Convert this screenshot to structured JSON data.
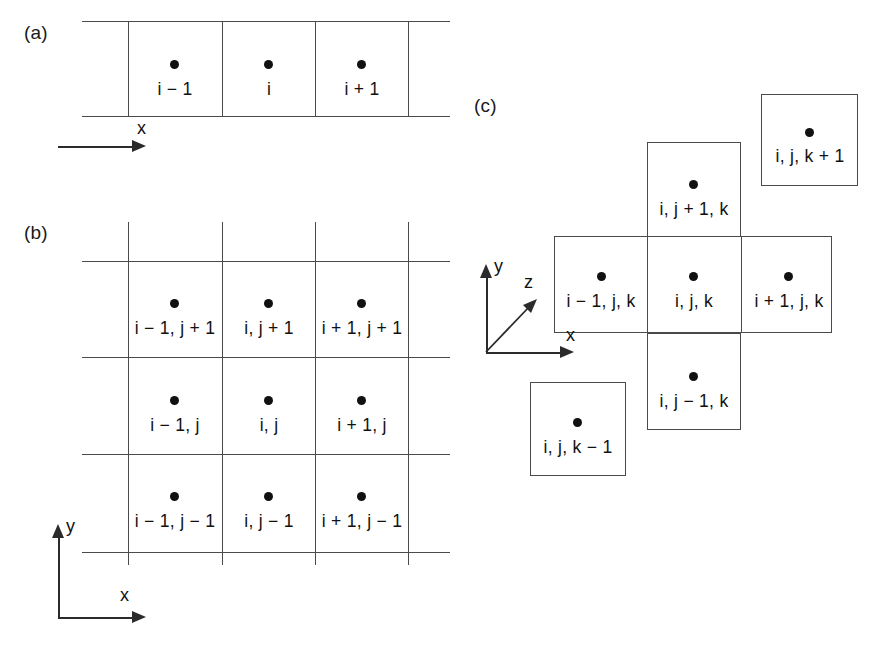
{
  "figure": {
    "type": "diagram",
    "panels": [
      {
        "id": "a",
        "label": "(a)",
        "dimension": "1D",
        "cells": [
          {
            "label": "i − 1"
          },
          {
            "label": "i"
          },
          {
            "label": "i + 1"
          }
        ],
        "axes": [
          {
            "name": "x",
            "direction": "right"
          }
        ]
      },
      {
        "id": "b",
        "label": "(b)",
        "dimension": "2D",
        "rows": [
          {
            "cells": [
              {
                "label": "i − 1, j + 1"
              },
              {
                "label": "i, j + 1"
              },
              {
                "label": "i + 1, j + 1"
              }
            ]
          },
          {
            "cells": [
              {
                "label": "i − 1, j"
              },
              {
                "label": "i, j"
              },
              {
                "label": "i + 1, j"
              }
            ]
          },
          {
            "cells": [
              {
                "label": "i − 1, j − 1"
              },
              {
                "label": "i, j − 1"
              },
              {
                "label": "i + 1, j − 1"
              }
            ]
          }
        ],
        "axes": [
          {
            "name": "y",
            "direction": "up"
          },
          {
            "name": "x",
            "direction": "right"
          }
        ]
      },
      {
        "id": "c",
        "label": "(c)",
        "dimension": "3D",
        "cells": [
          {
            "label": "i, j, k + 1"
          },
          {
            "label": "i, j + 1, k"
          },
          {
            "label": "i − 1, j, k"
          },
          {
            "label": "i, j, k"
          },
          {
            "label": "i + 1, j, k"
          },
          {
            "label": "i, j − 1, k"
          },
          {
            "label": "i, j, k − 1"
          }
        ],
        "axes": [
          {
            "name": "y",
            "direction": "up"
          },
          {
            "name": "z",
            "direction": "diagonal-up-right"
          },
          {
            "name": "x",
            "direction": "right"
          }
        ]
      }
    ]
  },
  "colors": {
    "grid_line": "#4a4a4a",
    "node": "#111111",
    "axis": "#2b2b2b",
    "background": "#ffffff"
  }
}
